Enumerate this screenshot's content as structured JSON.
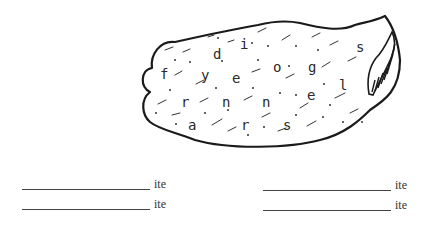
{
  "puzzle": {
    "letters": [
      {
        "ch": "d",
        "x": 213,
        "y": 47
      },
      {
        "ch": "i",
        "x": 240,
        "y": 37
      },
      {
        "ch": "s",
        "x": 356,
        "y": 40
      },
      {
        "ch": "o",
        "x": 273,
        "y": 60
      },
      {
        "ch": "g",
        "x": 308,
        "y": 60
      },
      {
        "ch": "f",
        "x": 160,
        "y": 67
      },
      {
        "ch": "y",
        "x": 201,
        "y": 68
      },
      {
        "ch": "e",
        "x": 232,
        "y": 71
      },
      {
        "ch": "l",
        "x": 339,
        "y": 78
      },
      {
        "ch": "e",
        "x": 307,
        "y": 88
      },
      {
        "ch": "r",
        "x": 181,
        "y": 95
      },
      {
        "ch": "n",
        "x": 222,
        "y": 95
      },
      {
        "ch": "n",
        "x": 262,
        "y": 95
      },
      {
        "ch": "a",
        "x": 188,
        "y": 118
      },
      {
        "ch": "r",
        "x": 241,
        "y": 118
      },
      {
        "ch": "s",
        "x": 283,
        "y": 118
      }
    ]
  },
  "answers": [
    {
      "suffix": "ite",
      "value": ""
    },
    {
      "suffix": "ite",
      "value": ""
    },
    {
      "suffix": "ite",
      "value": ""
    },
    {
      "suffix": "ite",
      "value": ""
    }
  ]
}
